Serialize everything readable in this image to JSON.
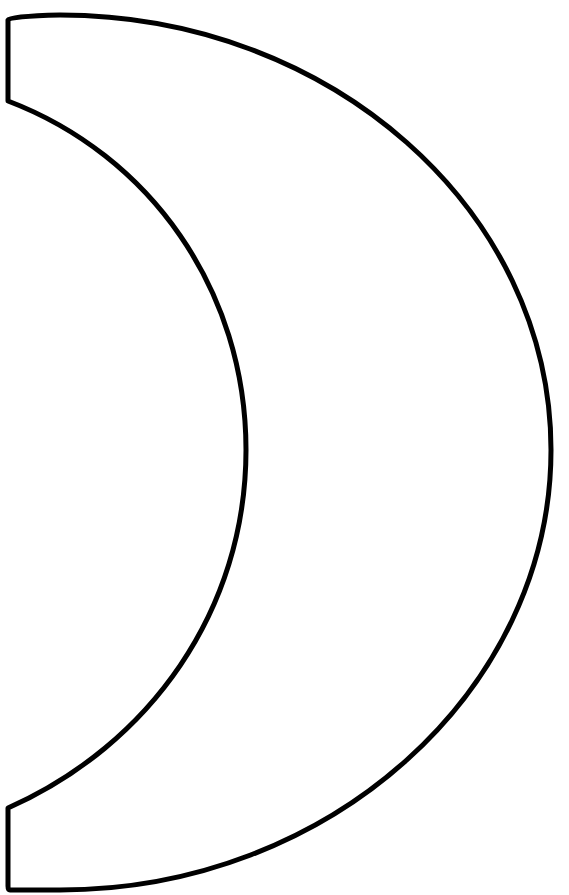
{
  "figure": {
    "style": "coloring-page line art",
    "stroke_color": "#000000",
    "fill_color": "#ffffff",
    "background": "#ffffff",
    "stroke_width": 5
  },
  "header": {
    "clipped_caption": ""
  }
}
